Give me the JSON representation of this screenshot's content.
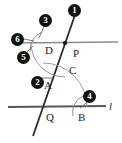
{
  "figure": {
    "type": "geometry-construction",
    "canvas": {
      "width": 122,
      "height": 143,
      "background": "#ffffff"
    },
    "colors": {
      "ink": "#222222",
      "line_upper": "#8c8c8c",
      "line_lower": "#555555",
      "transversal": "#2b2b2b",
      "arc": "#9a9a9a",
      "badge_fill": "#111111",
      "badge_text": "#ffffff"
    },
    "point_labels": [
      {
        "id": "D",
        "text": "D",
        "x": 45,
        "y": 45
      },
      {
        "id": "P",
        "text": "P",
        "x": 73,
        "y": 48
      },
      {
        "id": "C",
        "text": "C",
        "x": 69,
        "y": 65
      },
      {
        "id": "A",
        "text": "A",
        "x": 44,
        "y": 80
      },
      {
        "id": "Q",
        "text": "Q",
        "x": 46,
        "y": 112
      },
      {
        "id": "B",
        "text": "B",
        "x": 78,
        "y": 112
      }
    ],
    "line_labels": [
      {
        "id": "l",
        "text": "l",
        "x": 109,
        "y": 101
      }
    ],
    "step_badges": [
      {
        "id": "badge-1",
        "text": "1",
        "x": 68,
        "y": 4
      },
      {
        "id": "badge-3",
        "text": "3",
        "x": 39,
        "y": 14
      },
      {
        "id": "badge-6",
        "text": "6",
        "x": 11,
        "y": 33
      },
      {
        "id": "badge-5",
        "text": "5",
        "x": 17,
        "y": 51
      },
      {
        "id": "badge-2",
        "text": "2",
        "x": 31,
        "y": 76
      },
      {
        "id": "badge-4",
        "text": "4",
        "x": 83,
        "y": 90
      }
    ],
    "geometry": {
      "upper_line": {
        "x1": 12,
        "y1": 43,
        "x2": 118,
        "y2": 42
      },
      "lower_line": {
        "x1": 8,
        "y1": 107,
        "x2": 106,
        "y2": 106
      },
      "transversal": {
        "x1": 76,
        "y1": 12,
        "x2": 33,
        "y2": 136
      },
      "intersection_P": {
        "x": 65,
        "y": 43
      },
      "intersection_Q": {
        "x": 43,
        "y": 107
      }
    }
  }
}
